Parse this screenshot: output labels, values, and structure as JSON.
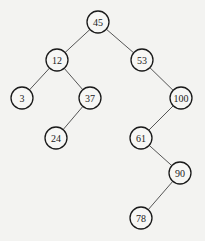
{
  "diagram": {
    "type": "binary-search-tree",
    "nodes": [
      {
        "id": "n45",
        "label": "45",
        "x": 98,
        "y": 22
      },
      {
        "id": "n12",
        "label": "12",
        "x": 57,
        "y": 60
      },
      {
        "id": "n53",
        "label": "53",
        "x": 142,
        "y": 60
      },
      {
        "id": "n3",
        "label": "3",
        "x": 22,
        "y": 98
      },
      {
        "id": "n37",
        "label": "37",
        "x": 90,
        "y": 98
      },
      {
        "id": "n100",
        "label": "100",
        "x": 181,
        "y": 98
      },
      {
        "id": "n24",
        "label": "24",
        "x": 56,
        "y": 138
      },
      {
        "id": "n61",
        "label": "61",
        "x": 141,
        "y": 138
      },
      {
        "id": "n90",
        "label": "90",
        "x": 180,
        "y": 173
      },
      {
        "id": "n78",
        "label": "78",
        "x": 141,
        "y": 218
      }
    ],
    "edges": [
      {
        "from": "n45",
        "to": "n12"
      },
      {
        "from": "n45",
        "to": "n53"
      },
      {
        "from": "n12",
        "to": "n3"
      },
      {
        "from": "n12",
        "to": "n37"
      },
      {
        "from": "n53",
        "to": "n100"
      },
      {
        "from": "n37",
        "to": "n24"
      },
      {
        "from": "n100",
        "to": "n61"
      },
      {
        "from": "n61",
        "to": "n90"
      },
      {
        "from": "n90",
        "to": "n78"
      }
    ]
  }
}
